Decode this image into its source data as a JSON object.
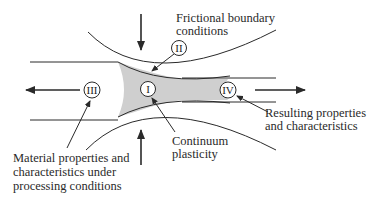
{
  "diagram": {
    "type": "metal-forming process schematic (rolling gap)",
    "colors": {
      "line": "#2a2a2a",
      "deformation_zone": "#cfcfcf",
      "background": "#ffffff"
    },
    "regions": [
      {
        "id": "I",
        "name": "deformation-zone",
        "label": "I"
      },
      {
        "id": "II",
        "name": "roll-workpiece-interface",
        "label": "II"
      },
      {
        "id": "III",
        "name": "incoming-material",
        "label": "III"
      },
      {
        "id": "IV",
        "name": "outgoing-product",
        "label": "IV"
      }
    ],
    "annotations": {
      "frictional": [
        "Frictional boundary",
        "conditions"
      ],
      "continuum": [
        "Continuum",
        "plasticity"
      ],
      "resulting": [
        "Resulting properties",
        "and characteristics"
      ],
      "material": [
        "Material properties and",
        "characteristics under",
        "processing conditions"
      ]
    },
    "arrows": [
      {
        "name": "top-roll-force",
        "direction": "down"
      },
      {
        "name": "bottom-roll-force",
        "direction": "up"
      },
      {
        "name": "left-pull",
        "direction": "left"
      },
      {
        "name": "right-pull",
        "direction": "right"
      }
    ]
  }
}
